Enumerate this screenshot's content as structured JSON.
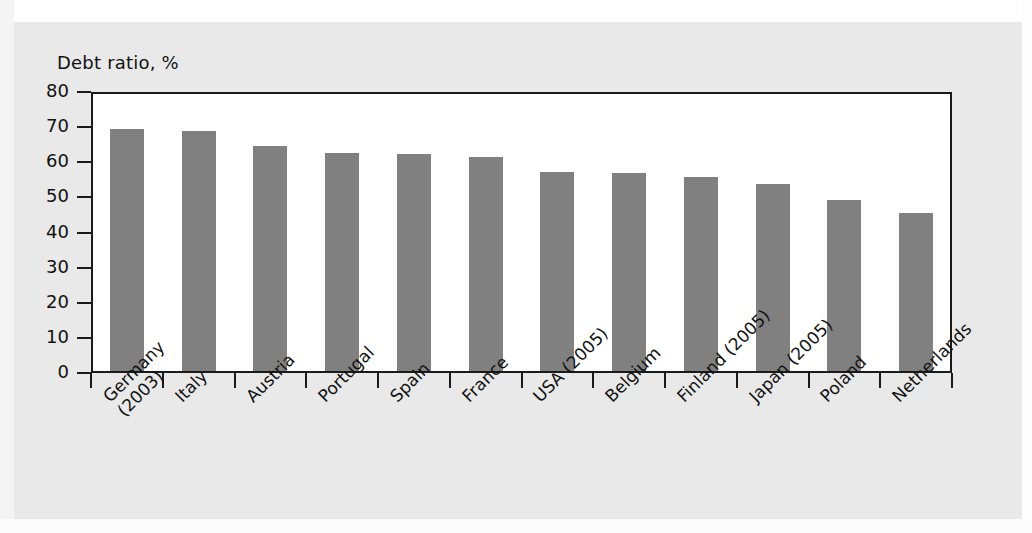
{
  "chart_data": {
    "type": "bar",
    "title": "Debt ratio, %",
    "xlabel": "",
    "ylabel": "Debt ratio, %",
    "ylim": [
      0,
      80
    ],
    "yticks": [
      0,
      10,
      20,
      30,
      40,
      50,
      60,
      70,
      80
    ],
    "ytick_labels": [
      "0",
      "10",
      "20",
      "30",
      "40",
      "50",
      "60",
      "70",
      "80"
    ],
    "grid": false,
    "legend": "none",
    "bar_color": "#808080",
    "axis_color": "#1a1a1a",
    "plot_background": "#ffffff",
    "page_background": "#e9e9e9",
    "categories": [
      "Germany\n(2003)",
      "Italy",
      "Austria",
      "Portugal",
      "Spain",
      "France",
      "USA (2005)",
      "Belgium",
      "Finland (2005)",
      "Japan (2005)",
      "Poland",
      "Netherlands"
    ],
    "values": [
      69.0,
      68.3,
      64.0,
      62.2,
      61.7,
      61.0,
      56.7,
      56.4,
      55.3,
      53.2,
      48.7,
      44.9
    ]
  }
}
